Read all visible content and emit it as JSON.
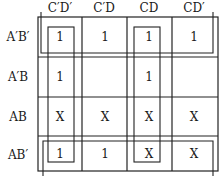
{
  "kmap": {
    "column_headers": [
      "C′D′",
      "C′D",
      "CD",
      "CD′"
    ],
    "row_headers": [
      "A′B′",
      "A′B",
      "AB",
      "AB′"
    ],
    "cells": [
      [
        "1",
        "1",
        "1",
        "1"
      ],
      [
        "1",
        "",
        "1",
        ""
      ],
      [
        "X",
        "X",
        "X",
        "X"
      ],
      [
        "1",
        "1",
        "X",
        "X"
      ]
    ],
    "groupings": [
      {
        "name": "top-row-group",
        "cells": "row A′B′ all columns"
      },
      {
        "name": "bottom-row-group",
        "cells": "row AB′ all columns"
      },
      {
        "name": "column-C′D′-group",
        "cells": "column C′D′ all rows"
      },
      {
        "name": "column-CD-group",
        "cells": "column CD all rows"
      }
    ]
  }
}
